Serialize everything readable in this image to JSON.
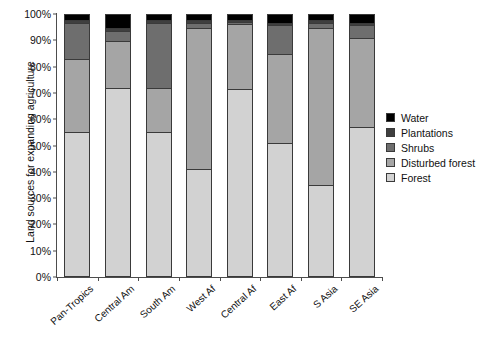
{
  "chart_data": {
    "type": "bar",
    "subtype": "stacked-bar-100percent",
    "title": "",
    "xlabel": "",
    "ylabel": "Land sources for expanding agriculture",
    "ylim": [
      0,
      100
    ],
    "yticks": [
      "0%",
      "10%",
      "20%",
      "30%",
      "40%",
      "50%",
      "60%",
      "70%",
      "80%",
      "90%",
      "100%"
    ],
    "ytick_values": [
      0,
      10,
      20,
      30,
      40,
      50,
      60,
      70,
      80,
      90,
      100
    ],
    "grid": false,
    "legend_position": "right",
    "categories": [
      "Pan-Tropics",
      "Central Am",
      "South Am",
      "West Af",
      "Central Af",
      "East Af",
      "S Asia",
      "SE Asia"
    ],
    "series": [
      {
        "name": "Forest",
        "color": "#d2d2d2",
        "values": [
          55,
          72,
          55,
          41,
          71.5,
          51,
          35,
          57
        ]
      },
      {
        "name": "Disturbed forest",
        "color": "#a5a5a5",
        "values": [
          28,
          18,
          17,
          54,
          25,
          34,
          60,
          34
        ]
      },
      {
        "name": "Shrubs",
        "color": "#6e6e6e",
        "values": [
          14,
          4,
          25,
          2,
          1,
          11,
          2,
          5
        ]
      },
      {
        "name": "Plantations",
        "color": "#3f3f3f",
        "values": [
          1,
          1,
          1,
          1,
          0.5,
          1,
          1,
          1
        ]
      },
      {
        "name": "Water",
        "color": "#000000",
        "values": [
          2,
          5,
          2,
          2,
          2,
          3,
          2,
          3
        ]
      }
    ],
    "legend_order_top_to_bottom": [
      "Water",
      "Plantations",
      "Shrubs",
      "Disturbed forest",
      "Forest"
    ]
  }
}
